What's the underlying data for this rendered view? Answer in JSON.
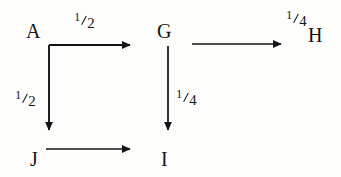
{
  "diagram": {
    "background_color": "#fdfdfc",
    "ink_color": "#141414",
    "nodes": [
      {
        "id": "A",
        "label": "A",
        "x": 26,
        "y": 21
      },
      {
        "id": "G",
        "label": "G",
        "x": 157,
        "y": 21
      },
      {
        "id": "H",
        "label": "H",
        "x": 308,
        "y": 25
      },
      {
        "id": "J",
        "label": "J",
        "x": 30,
        "y": 149
      },
      {
        "id": "I",
        "label": "I",
        "x": 161,
        "y": 149
      }
    ],
    "edges": [
      {
        "id": "a-right",
        "from": "A",
        "direction": "right",
        "label": {
          "numerator": "1",
          "denominator": "2",
          "text": "1/2"
        }
      },
      {
        "id": "a-down",
        "from": "A",
        "to": "J",
        "direction": "down",
        "label": {
          "numerator": "1",
          "denominator": "2",
          "text": "1/2"
        }
      },
      {
        "id": "j-right",
        "from": "J",
        "direction": "right",
        "label": null
      },
      {
        "id": "g-right",
        "from": "G",
        "to": "H",
        "direction": "right",
        "label": {
          "numerator": "1",
          "denominator": "4",
          "text": "1/4"
        }
      },
      {
        "id": "g-down",
        "from": "G",
        "to": "I",
        "direction": "down",
        "label": {
          "numerator": "1",
          "denominator": "4",
          "text": "1/4"
        }
      }
    ]
  }
}
